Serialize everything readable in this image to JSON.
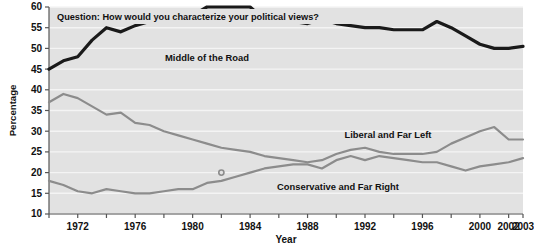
{
  "figure": {
    "question_label": "Question: How would you characterize your political views?",
    "xlabel": "Year",
    "ylabel": "Percentage"
  },
  "annotations": {
    "middle": "Middle of the Road",
    "liberal": "Liberal and Far Left",
    "conservative": "Conservative and Far Right"
  },
  "colors": {
    "plot_background": "#e2e2e2",
    "gridline": "#f4f4f4",
    "axis": "#555555",
    "middle_line": "#1a1a1a",
    "liberal_line": "#8c8c8c",
    "conservative_line": "#8c8c8c",
    "text": "#111111",
    "page_background": "#ffffff"
  },
  "chart_data": {
    "type": "line",
    "title": "Question: How would you characterize your political views?",
    "xlabel": "Year",
    "ylabel": "Percentage",
    "xlim": [
      1970,
      2003
    ],
    "ylim": [
      10,
      60
    ],
    "ytick_step": 5,
    "grid": true,
    "legend": "inline-annotations",
    "yticks": [
      10,
      15,
      20,
      25,
      30,
      35,
      40,
      45,
      50,
      55,
      60
    ],
    "xticks": [
      1970,
      1972,
      1974,
      1976,
      1978,
      1980,
      1982,
      1984,
      1986,
      1988,
      1990,
      1992,
      1994,
      1996,
      1998,
      2000,
      2002,
      2003
    ],
    "xtick_labels": [
      "",
      "1972",
      "",
      "1976",
      "",
      "1980",
      "",
      "1984",
      "",
      "1988",
      "",
      "1992",
      "",
      "1996",
      "",
      "2000",
      "2002",
      "2003"
    ],
    "x": [
      1970,
      1971,
      1972,
      1973,
      1974,
      1975,
      1976,
      1977,
      1978,
      1979,
      1980,
      1981,
      1982,
      1983,
      1984,
      1985,
      1986,
      1987,
      1988,
      1989,
      1990,
      1991,
      1992,
      1993,
      1994,
      1995,
      1996,
      1997,
      1998,
      1999,
      2000,
      2001,
      2002,
      2003
    ],
    "series": [
      {
        "name": "Middle of the Road",
        "color": "#1a1a1a",
        "width": 3.2,
        "values": [
          45,
          47,
          48,
          52,
          55,
          54,
          55.5,
          56.5,
          57.5,
          58,
          58,
          60,
          60,
          60,
          60,
          57,
          57,
          56.5,
          56,
          57,
          56,
          55.5,
          55,
          55,
          54.5,
          54.5,
          54.5,
          56.5,
          55,
          53,
          51,
          50,
          50,
          50.5
        ]
      },
      {
        "name": "Liberal and Far Left",
        "color": "#8c8c8c",
        "width": 2.2,
        "values": [
          37,
          39,
          38,
          36,
          34,
          34.5,
          32,
          31.5,
          30,
          29,
          28,
          27,
          26,
          25.5,
          25,
          24,
          23.5,
          23,
          22.5,
          23,
          24.5,
          25.5,
          26,
          25,
          24.5,
          24.5,
          24.5,
          25,
          27,
          28.5,
          30,
          31,
          28,
          28
        ]
      },
      {
        "name": "Conservative and Far Right",
        "color": "#8c8c8c",
        "width": 2.2,
        "values": [
          18,
          17,
          15.5,
          15,
          16,
          15.5,
          15,
          15,
          15.5,
          16,
          16,
          17.5,
          18,
          19,
          20,
          21,
          21.5,
          22,
          22,
          21,
          23,
          24,
          23,
          24,
          23.5,
          23,
          22.5,
          22.5,
          21.5,
          20.5,
          21.5,
          22,
          22.5,
          23.5
        ]
      }
    ],
    "crossing_point": {
      "year": 1982,
      "value": 20
    }
  }
}
